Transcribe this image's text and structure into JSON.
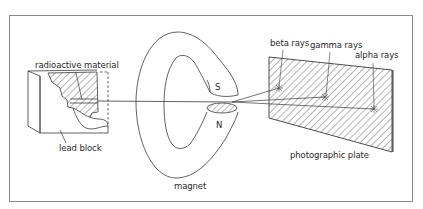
{
  "figure": {
    "type": "diagram",
    "colors": {
      "line": "#3a3a3a",
      "frame": "#8a8a8a",
      "hatch": "#444444",
      "background": "#ffffff"
    }
  },
  "labels": {
    "radioactive_material": "radioactive material",
    "lead_block": "lead block",
    "magnet": "magnet",
    "south_pole": "S",
    "north_pole": "N",
    "beta_rays": "beta rays",
    "gamma_rays": "gamma rays",
    "alpha_rays": "alpha rays",
    "photographic_plate": "photographic plate"
  },
  "components": [
    {
      "id": "lead-block",
      "label": "lead block"
    },
    {
      "id": "radioactive-material",
      "label": "radioactive material"
    },
    {
      "id": "magnet",
      "label": "magnet",
      "poles": [
        "S",
        "N"
      ]
    },
    {
      "id": "photographic-plate",
      "label": "photographic plate"
    }
  ],
  "rays": [
    {
      "name": "beta rays",
      "deflection": "upward, most deflected"
    },
    {
      "name": "gamma rays",
      "deflection": "undeflected"
    },
    {
      "name": "alpha rays",
      "deflection": "downward, slightly deflected"
    }
  ]
}
